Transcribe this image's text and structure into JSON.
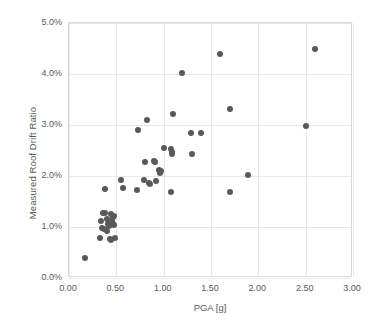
{
  "chart_data": {
    "type": "scatter",
    "title": "",
    "xlabel": "PGA [g]",
    "ylabel": "Measured Roof Drift Ratio",
    "xlim": [
      0.0,
      3.0
    ],
    "ylim": [
      0.0,
      5.0
    ],
    "xticks": [
      0.0,
      0.5,
      1.0,
      1.5,
      2.0,
      2.5,
      3.0
    ],
    "xtick_labels": [
      "0.00",
      "0.50",
      "1.00",
      "1.50",
      "2.00",
      "2.50",
      "3.00"
    ],
    "yticks": [
      0.0,
      1.0,
      2.0,
      3.0,
      4.0,
      5.0
    ],
    "ytick_labels": [
      "0.0%",
      "1.0%",
      "2.0%",
      "3.0%",
      "4.0%",
      "5.0%"
    ],
    "grid": true,
    "legend": null,
    "marker_color": "#595959",
    "marker_size_px": 6,
    "series": [
      {
        "name": "Measured roof drift vs PGA",
        "points": [
          [
            0.17,
            0.4
          ],
          [
            0.33,
            0.78
          ],
          [
            0.34,
            1.12
          ],
          [
            0.36,
            1.27
          ],
          [
            0.38,
            1.27
          ],
          [
            0.35,
            0.98
          ],
          [
            0.37,
            0.97
          ],
          [
            0.4,
            1.15
          ],
          [
            0.41,
            1.05
          ],
          [
            0.4,
            0.92
          ],
          [
            0.42,
            1.02
          ],
          [
            0.43,
            0.76
          ],
          [
            0.44,
            0.74
          ],
          [
            0.46,
            1.2
          ],
          [
            0.48,
            1.22
          ],
          [
            0.47,
            1.06
          ],
          [
            0.48,
            1.04
          ],
          [
            0.49,
            0.78
          ],
          [
            0.44,
            1.25
          ],
          [
            0.45,
            1.12
          ],
          [
            0.38,
            1.75
          ],
          [
            0.55,
            1.93
          ],
          [
            0.57,
            1.76
          ],
          [
            0.72,
            1.72
          ],
          [
            0.73,
            2.9
          ],
          [
            0.79,
            1.93
          ],
          [
            0.8,
            2.27
          ],
          [
            0.82,
            3.1
          ],
          [
            0.84,
            1.86
          ],
          [
            0.86,
            1.85
          ],
          [
            0.9,
            2.3
          ],
          [
            0.91,
            2.27
          ],
          [
            0.92,
            1.9
          ],
          [
            0.95,
            2.12
          ],
          [
            0.96,
            2.06
          ],
          [
            0.97,
            2.09
          ],
          [
            1.0,
            2.54
          ],
          [
            1.08,
            2.53
          ],
          [
            1.09,
            2.47
          ],
          [
            1.09,
            2.44
          ],
          [
            1.08,
            1.68
          ],
          [
            1.1,
            3.21
          ],
          [
            1.19,
            4.01
          ],
          [
            1.29,
            2.84
          ],
          [
            1.3,
            2.44
          ],
          [
            1.39,
            2.85
          ],
          [
            1.59,
            4.4
          ],
          [
            1.7,
            3.31
          ],
          [
            1.7,
            1.68
          ],
          [
            1.89,
            2.02
          ],
          [
            2.5,
            2.98
          ],
          [
            2.6,
            4.5
          ]
        ]
      }
    ]
  },
  "axes": {
    "x_title": "PGA [g]",
    "y_title": "Measured Roof Drift Ratio"
  }
}
